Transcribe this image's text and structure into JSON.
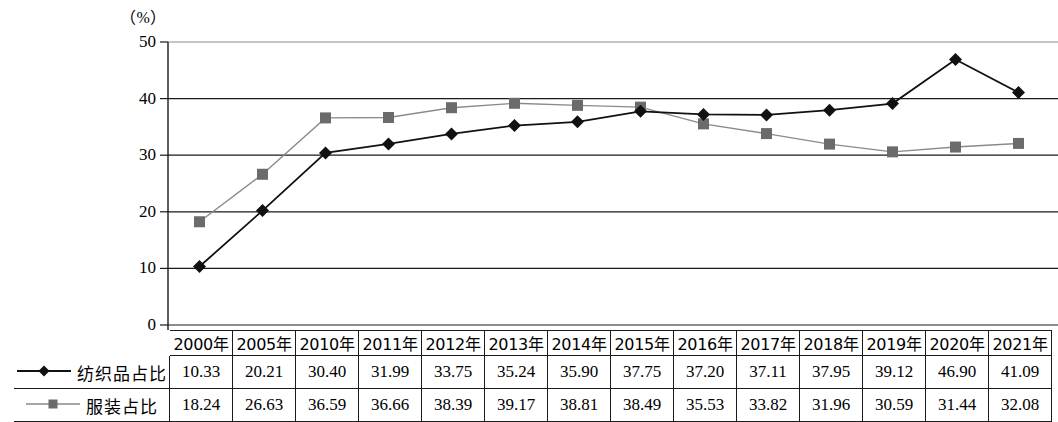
{
  "chart_data": {
    "type": "line",
    "title": "",
    "subtitle": "",
    "xlabel": "",
    "ylabel": "（%）",
    "unit_label": "（%）",
    "categories": [
      "2000年",
      "2005年",
      "2010年",
      "2011年",
      "2012年",
      "2013年",
      "2014年",
      "2015年",
      "2016年",
      "2017年",
      "2018年",
      "2019年",
      "2020年",
      "2021年"
    ],
    "ylim": [
      0,
      50
    ],
    "yticks": [
      0,
      10,
      20,
      30,
      40,
      50
    ],
    "ytick_labels": [
      "0",
      "10",
      "20",
      "30",
      "40",
      "50"
    ],
    "grid": true,
    "grid_axis": "y",
    "legend_position": "table-left",
    "series": [
      {
        "name": "纺织品占比",
        "marker": "diamond",
        "color": "#111111",
        "line_color": "#111111",
        "values": [
          10.33,
          20.21,
          30.4,
          31.99,
          33.75,
          35.24,
          35.9,
          37.75,
          37.2,
          37.11,
          37.95,
          39.12,
          46.9,
          41.09
        ]
      },
      {
        "name": "服装占比",
        "marker": "square",
        "color": "#6b6b6b",
        "line_color": "#8a8a8a",
        "values": [
          18.24,
          26.63,
          36.59,
          36.66,
          38.39,
          39.17,
          38.81,
          38.49,
          35.53,
          33.82,
          31.96,
          30.59,
          31.44,
          32.08
        ]
      }
    ]
  },
  "table": {
    "header_blank": "",
    "columns": [
      "2000年",
      "2005年",
      "2010年",
      "2011年",
      "2012年",
      "2013年",
      "2014年",
      "2015年",
      "2016年",
      "2017年",
      "2018年",
      "2019年",
      "2020年",
      "2021年"
    ],
    "rows": [
      {
        "label": "纺织品占比",
        "marker": "diamond",
        "values": [
          "10.33",
          "20.21",
          "30.40",
          "31.99",
          "33.75",
          "35.24",
          "35.90",
          "37.75",
          "37.20",
          "37.11",
          "37.95",
          "39.12",
          "46.90",
          "41.09"
        ]
      },
      {
        "label": "服装占比",
        "marker": "square",
        "values": [
          "18.24",
          "26.63",
          "36.59",
          "36.66",
          "38.39",
          "39.17",
          "38.81",
          "38.49",
          "35.53",
          "33.82",
          "31.96",
          "30.59",
          "31.44",
          "32.08"
        ]
      }
    ]
  },
  "colors": {
    "series1": "#111111",
    "series2": "#8a8a8a",
    "series2_marker": "#6b6b6b",
    "grid": "#1a1a1a",
    "top_rule": "#8d8d8d",
    "border": "#1a1a1a"
  }
}
